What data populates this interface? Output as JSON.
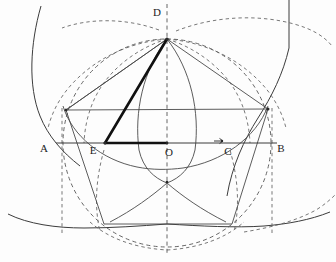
{
  "figure": {
    "canvas": {
      "width": 336,
      "height": 262,
      "background": "#fdfdfd"
    },
    "colors": {
      "stroke_solid": "#4a4a4a",
      "stroke_dashed": "#555555",
      "stroke_bold": "#111111",
      "label": "#1c1c1c"
    },
    "labels": [
      {
        "key": "A",
        "text": "A",
        "x": 44,
        "y": 152
      },
      {
        "key": "E",
        "text": "E",
        "x": 93,
        "y": 154
      },
      {
        "key": "O",
        "text": "O",
        "x": 169,
        "y": 156
      },
      {
        "key": "C",
        "text": "C",
        "x": 228,
        "y": 155
      },
      {
        "key": "B",
        "text": "B",
        "x": 281,
        "y": 152
      },
      {
        "key": "D",
        "text": "D",
        "x": 157,
        "y": 16
      }
    ],
    "points": [
      {
        "key": "A",
        "x": 56,
        "y": 143
      },
      {
        "key": "E",
        "x": 105,
        "y": 143
      },
      {
        "key": "O",
        "x": 167,
        "y": 143
      },
      {
        "key": "C",
        "x": 222,
        "y": 141
      },
      {
        "key": "B",
        "x": 277,
        "y": 143
      },
      {
        "key": "D",
        "x": 167,
        "y": 39
      },
      {
        "key": "P_upper_left",
        "x": 66,
        "y": 110
      },
      {
        "key": "P_upper_right",
        "x": 268,
        "y": 109
      },
      {
        "key": "P_lower_left",
        "x": 104,
        "y": 224
      },
      {
        "key": "P_lower_right",
        "x": 232,
        "y": 224
      },
      {
        "key": "vesica_bottom",
        "x": 167,
        "y": 182
      }
    ],
    "notes": {
      "baseline_y": 143,
      "center_x": 167,
      "main_circle_radius": 104,
      "bold_segments": [
        "E-D",
        "E-O"
      ],
      "dashed_axis": "vertical through O and D"
    }
  }
}
